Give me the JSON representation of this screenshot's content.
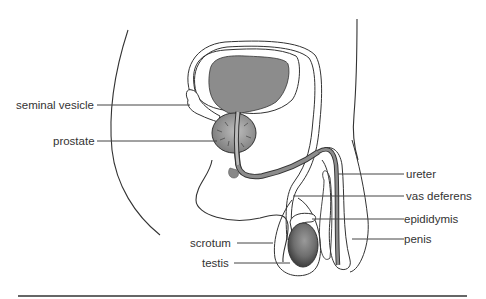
{
  "diagram": {
    "labels": {
      "seminal_vesicle": "seminal vesicle",
      "prostate": "prostate",
      "ureter": "ureter",
      "vas_deferens": "vas deferens",
      "epididymis": "epididymis",
      "penis": "penis",
      "scrotum": "scrotum",
      "testis": "testis"
    },
    "colors": {
      "outline": "#333333",
      "organ_fill": "#8c8c8c",
      "dark_fill": "#5a5a5a",
      "leader_line": "#444444",
      "text": "#333333"
    }
  }
}
